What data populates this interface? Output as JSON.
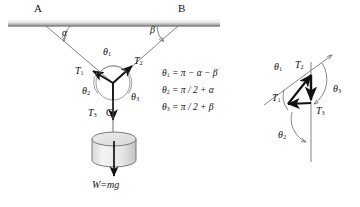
{
  "figure": {
    "type": "physics-free-body-diagram"
  },
  "ceiling": {
    "support_points": [
      {
        "name": "point-A",
        "label": "A",
        "x": 38,
        "y": 8
      },
      {
        "name": "point-B",
        "label": "B",
        "x": 182,
        "y": 8
      }
    ],
    "bar": {
      "x": 8,
      "y": 19,
      "width": 212,
      "height": 7,
      "color_top": "#f2f2f2",
      "color_bottom": "#9a9a9a"
    }
  },
  "angles": {
    "alpha": {
      "label": "α",
      "x": 61,
      "y": 30
    },
    "beta": {
      "label": "β",
      "x": 151,
      "y": 27
    }
  },
  "junction": {
    "label": "C",
    "x": 113,
    "y": 83,
    "circle_radius": 17
  },
  "tensions": [
    {
      "name": "tension-T1",
      "label": "T",
      "sub": "1",
      "x": 79,
      "y": 71
    },
    {
      "name": "tension-T2",
      "label": "T",
      "sub": "2",
      "x": 137,
      "y": 60
    },
    {
      "name": "tension-T3",
      "label": "T",
      "sub": "3",
      "x": 91,
      "y": 112
    }
  ],
  "theta_labels": [
    {
      "name": "theta1-left",
      "label": "θ",
      "sub": "1",
      "x": 105,
      "y": 52
    },
    {
      "name": "theta2-left",
      "label": "θ",
      "sub": "2",
      "x": 85,
      "y": 90
    },
    {
      "name": "theta3-left",
      "label": "θ",
      "sub": "3",
      "x": 133,
      "y": 96
    }
  ],
  "point_c_label": {
    "label": "C",
    "x": 107,
    "y": 112
  },
  "weight": {
    "label": "W=mg",
    "x": 92,
    "y": 184
  },
  "cylinder": {
    "cx": 114,
    "cy": 146,
    "rx": 22,
    "ry": 7,
    "height": 28,
    "fill": "#f0f0f0",
    "stroke": "#6b6b6b"
  },
  "equations": [
    {
      "name": "equation-theta1",
      "lhs": "θ",
      "lhs_sub": "1",
      "rhs": "= π − α − β",
      "x": 162,
      "y": 73
    },
    {
      "name": "equation-theta2",
      "lhs": "θ",
      "lhs_sub": "2",
      "rhs": "= π / 2 + α",
      "x": 162,
      "y": 90
    },
    {
      "name": "equation-theta3",
      "lhs": "θ",
      "lhs_sub": "3",
      "rhs": "= π / 2 + β",
      "x": 162,
      "y": 107
    }
  ],
  "vector_triangle": {
    "title": "force-triangle",
    "labels": [
      {
        "name": "vt-theta1",
        "label": "θ",
        "sub": "1",
        "x": 277,
        "y": 66
      },
      {
        "name": "vt-theta2",
        "label": "θ",
        "sub": "2",
        "x": 281,
        "y": 134
      },
      {
        "name": "vt-theta3",
        "label": "θ",
        "sub": "3",
        "x": 336,
        "y": 88
      },
      {
        "name": "vt-T1",
        "label": "T",
        "sub": "1",
        "x": 277,
        "y": 97
      },
      {
        "name": "vt-T2",
        "label": "T",
        "sub": "2",
        "x": 298,
        "y": 64
      },
      {
        "name": "vt-T3",
        "label": "T",
        "sub": "3",
        "x": 320,
        "y": 110
      }
    ]
  },
  "colors": {
    "stroke": "#3a3a3a",
    "vector": "#111111",
    "thin": "#8a8a8a",
    "text": "#111111"
  }
}
